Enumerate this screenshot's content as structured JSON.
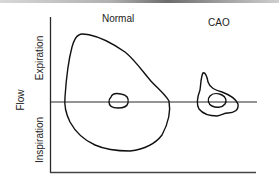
{
  "diagram": {
    "type": "flow-volume-loops",
    "panels": [
      {
        "label": "Normal"
      },
      {
        "label": "CAO"
      }
    ],
    "y_axis": {
      "title": "Flow",
      "upper_label": "Expiration",
      "lower_label": "Inspiration"
    },
    "colors": {
      "line": "#111111",
      "axis": "#333333",
      "background": "#ffffff"
    }
  }
}
